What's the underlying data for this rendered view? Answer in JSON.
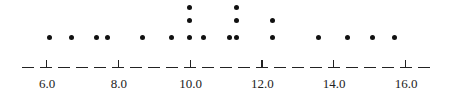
{
  "chart_data": {
    "type": "dot",
    "title": "",
    "xlabel": "",
    "ylabel": "",
    "xlim": [
      5.4,
      16.6
    ],
    "x_ticks": [
      6.0,
      8.0,
      10.0,
      12.0,
      14.0,
      16.0
    ],
    "x_tick_labels": [
      "6.0",
      "8.0",
      "10.0",
      "12.0",
      "14.0",
      "16.0"
    ],
    "axis_style": "dashed",
    "grid": false,
    "points": [
      {
        "x": 6.1,
        "count": 1
      },
      {
        "x": 6.7,
        "count": 1
      },
      {
        "x": 7.4,
        "count": 1
      },
      {
        "x": 7.7,
        "count": 1
      },
      {
        "x": 8.7,
        "count": 1
      },
      {
        "x": 9.5,
        "count": 1
      },
      {
        "x": 10.0,
        "count": 3
      },
      {
        "x": 10.4,
        "count": 1
      },
      {
        "x": 11.1,
        "count": 1
      },
      {
        "x": 11.3,
        "count": 3
      },
      {
        "x": 12.3,
        "count": 2
      },
      {
        "x": 13.6,
        "count": 1
      },
      {
        "x": 14.4,
        "count": 1
      },
      {
        "x": 15.1,
        "count": 1
      },
      {
        "x": 15.7,
        "count": 1
      }
    ],
    "values": [
      6.1,
      6.7,
      7.4,
      7.7,
      8.7,
      9.5,
      10.0,
      10.0,
      10.0,
      10.4,
      11.1,
      11.3,
      11.3,
      11.3,
      12.3,
      12.3,
      13.6,
      14.4,
      15.1,
      15.7
    ],
    "n": 20
  },
  "style": {
    "dot_color": "#111111",
    "axis_color": "#222222"
  }
}
